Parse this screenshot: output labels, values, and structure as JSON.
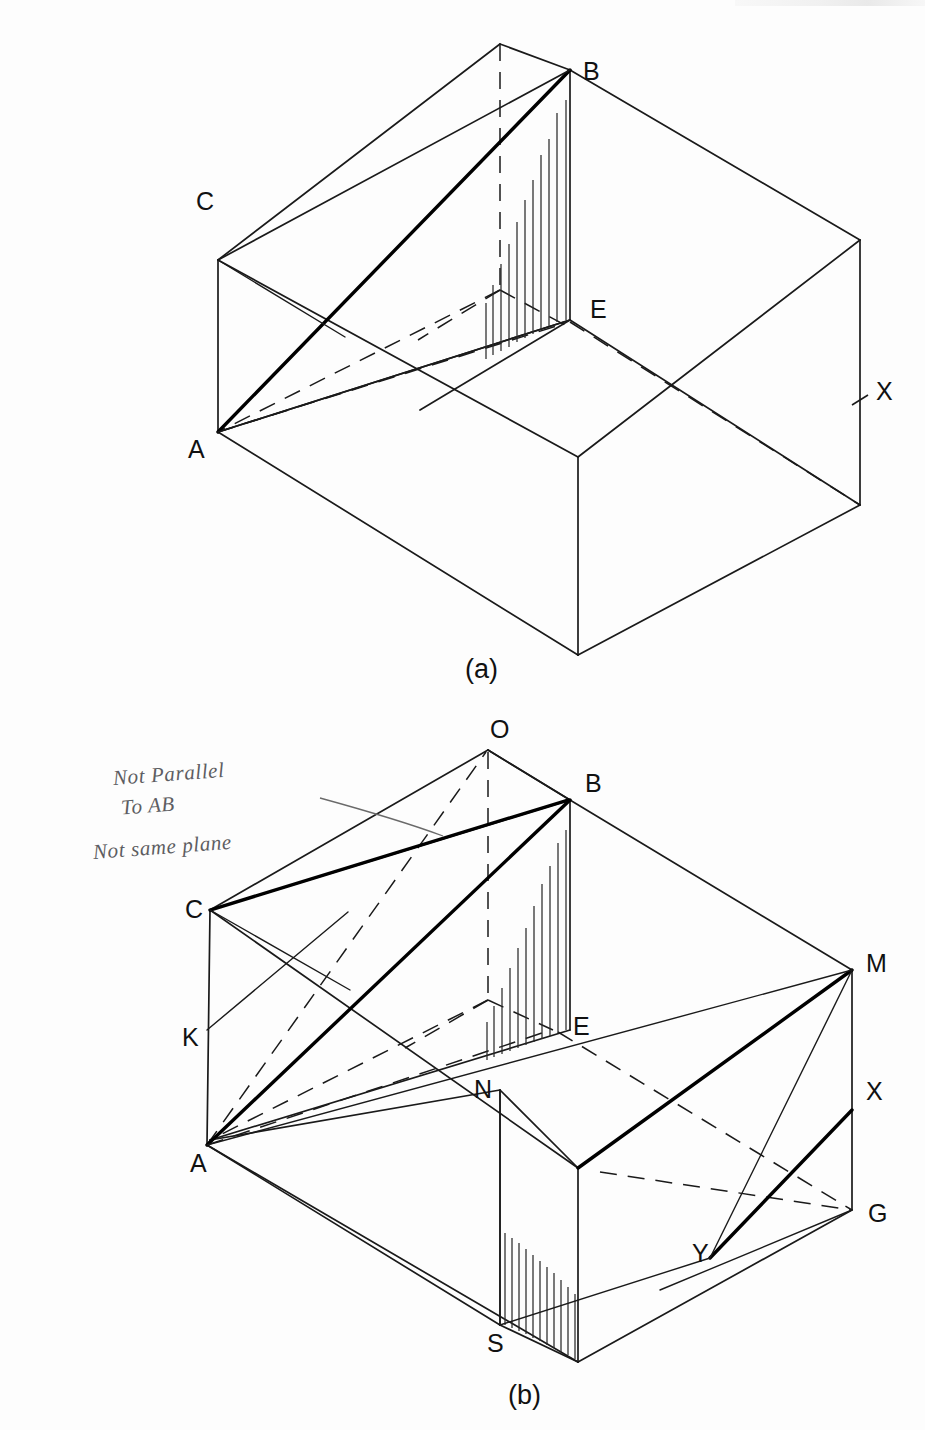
{
  "sheet": {
    "title": "Isometric box diagrams (a) and (b)",
    "background": "#fdfdfd",
    "ink": "#1a1a1a"
  },
  "figures": [
    {
      "id": "a",
      "caption": "(a)",
      "caption_pos": {
        "x": 465,
        "y": 678
      },
      "vertex_labels": [
        {
          "name": "B",
          "text": "B",
          "x": 583,
          "y": 80
        },
        {
          "name": "C",
          "text": "C",
          "x": 196,
          "y": 210
        },
        {
          "name": "E",
          "text": "E",
          "x": 590,
          "y": 318
        },
        {
          "name": "A",
          "text": "A",
          "x": 188,
          "y": 458
        },
        {
          "name": "X",
          "text": "X",
          "x": 876,
          "y": 400
        }
      ]
    },
    {
      "id": "b",
      "caption": "(b)",
      "caption_pos": {
        "x": 508,
        "y": 1404
      },
      "vertex_labels": [
        {
          "name": "O",
          "text": "O",
          "x": 490,
          "y": 738
        },
        {
          "name": "B",
          "text": "B",
          "x": 585,
          "y": 792
        },
        {
          "name": "C",
          "text": "C",
          "x": 185,
          "y": 918
        },
        {
          "name": "M",
          "text": "M",
          "x": 866,
          "y": 972
        },
        {
          "name": "K",
          "text": "K",
          "x": 182,
          "y": 1046
        },
        {
          "name": "E",
          "text": "E",
          "x": 573,
          "y": 1035
        },
        {
          "name": "N",
          "text": "N",
          "x": 474,
          "y": 1098
        },
        {
          "name": "X",
          "text": "X",
          "x": 866,
          "y": 1100
        },
        {
          "name": "A",
          "text": "A",
          "x": 190,
          "y": 1172
        },
        {
          "name": "G",
          "text": "G",
          "x": 868,
          "y": 1222
        },
        {
          "name": "Y",
          "text": "Y",
          "x": 692,
          "y": 1262
        },
        {
          "name": "S",
          "text": "S",
          "x": 487,
          "y": 1352
        }
      ],
      "annotations": [
        {
          "name": "not-parallel-note",
          "text": "Not Parallel\n To AB"
        },
        {
          "name": "not-same-plane-note",
          "text": "Not same plane"
        }
      ]
    }
  ],
  "colors": {
    "ink": "#1a1a1a",
    "bold_ink": "#000000",
    "hidden_edge": "#1a1a1a",
    "handwriting": "#5d5d62",
    "hatch": "#2b2b2b"
  }
}
